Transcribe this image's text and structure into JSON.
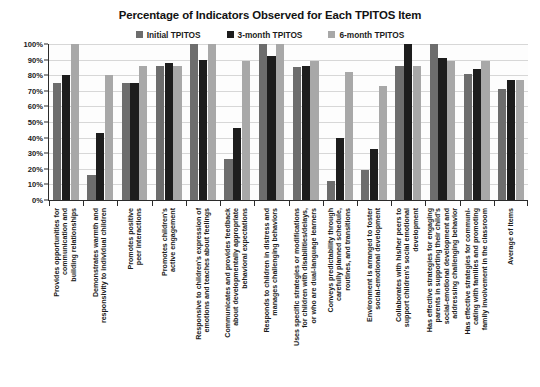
{
  "chart_data": {
    "type": "bar",
    "title": "Percentage of Indicators Observed for Each TPITOS Item",
    "xlabel": "",
    "ylabel": "",
    "ylim": [
      0,
      100
    ],
    "ytick_labels": [
      "100%",
      "90%",
      "80%",
      "70%",
      "60%",
      "50%",
      "40%",
      "30%",
      "20%",
      "10%",
      "0%"
    ],
    "ytick_values": [
      100,
      90,
      80,
      70,
      60,
      50,
      40,
      30,
      20,
      10,
      0
    ],
    "grid": true,
    "legend_position": "top-center",
    "categories": [
      "Provides opportunities for\ncommunication and\nbuilding relationships",
      "Demonstrates warmth and\nresponsivity to individual children",
      "Promotes positive\npeer interactions",
      "Promotes children's\nactive engagement",
      "Responsive to children's expression of\nemotions and teaches about feelings",
      "Communicates and provides feedback\nabout developmentally appropriate\nbehavioral expectations",
      "Responds to children in distress and\nmanages challenging behaviors",
      "Uses specific strategies or modifications\nfor children with disabilities/delays,\nor who are dual-language learners",
      "Conveys predictability through\ncarefully planned schedule,\nroutines, and transitions",
      "Environment is arranged to foster\nsocial-emotional development",
      "Collaborates with his/her peers to\nsupport children's social emotional\ndevelopment",
      "Has effective strategies for engaging\nparents in supporting their child's\nsocial-emotional development and\naddressing challenging behavior",
      "Has effective strategies for communi-\ncating with families and promoting\nfamily involvement in the classroom",
      "Average of Items"
    ],
    "series": [
      {
        "name": "Initial TPITOS",
        "color": "#6d6d6d",
        "values": [
          75,
          16,
          75,
          86,
          100,
          26,
          100,
          85,
          12,
          19,
          86,
          100,
          81,
          71
        ]
      },
      {
        "name": "3-month TPITOS",
        "color": "#1d1d1d",
        "values": [
          80,
          43,
          75,
          88,
          90,
          46,
          92,
          86,
          40,
          33,
          100,
          91,
          84,
          77
        ]
      },
      {
        "name": "6-month TPITOS",
        "color": "#a8a8a8",
        "values": [
          100,
          80,
          86,
          86,
          100,
          89,
          100,
          89,
          82,
          73,
          86,
          89,
          89,
          77
        ]
      }
    ]
  },
  "legend": {
    "items": [
      {
        "label": "Initial TPITOS",
        "color": "#6d6d6d"
      },
      {
        "label": "3-month TPITOS",
        "color": "#1d1d1d"
      },
      {
        "label": "6-month TPITOS",
        "color": "#a8a8a8"
      }
    ]
  }
}
